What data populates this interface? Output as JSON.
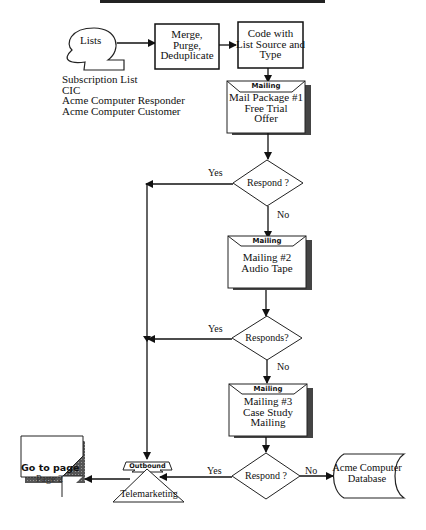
{
  "lists": {
    "label": "Lists",
    "sources": [
      "Subscription List",
      "CIC",
      "Acme Computer Responder",
      "Acme Computer Customer"
    ]
  },
  "merge": {
    "lines": [
      "Merge,",
      "Purge,",
      "Deduplicate"
    ]
  },
  "code": {
    "lines": [
      "Code with",
      "List Source and",
      "Type"
    ]
  },
  "mailing1": {
    "header": "Mailing",
    "lines": [
      "Mail Package #1",
      "Free Trial",
      "Offer"
    ]
  },
  "decision1": {
    "label": "Respond ?",
    "yes": "Yes",
    "no": "No"
  },
  "mailing2": {
    "header": "Mailing",
    "lines": [
      "Mailing #2",
      "Audio Tape"
    ]
  },
  "decision2": {
    "label": "Responds?",
    "yes": "Yes",
    "no": "No"
  },
  "mailing3": {
    "header": "Mailing",
    "lines": [
      "Mailing #3",
      "Case Study",
      "Mailing"
    ]
  },
  "decision3": {
    "label": "Respond ?",
    "yes": "Yes",
    "no": "No"
  },
  "database": {
    "lines": [
      "Acme Computer",
      "Database"
    ]
  },
  "telemarketing": {
    "header": "Outbound",
    "label": "Telemarketing"
  },
  "goto": {
    "title": "Go to page",
    "page": "Page 2"
  }
}
